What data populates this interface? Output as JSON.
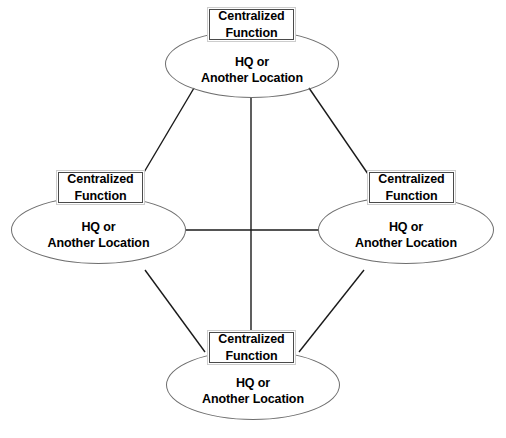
{
  "diagram": {
    "type": "network-hub-diagram",
    "background_color": "#ffffff",
    "edge_color": "#1a1a1a",
    "ellipse_stroke_color": "#6e6e6e",
    "box_border_color": "#4a4a4a",
    "nodes": [
      {
        "id": "top",
        "box_title_line1": "Centralized",
        "box_title_line2": "Function",
        "location_line1": "HQ or",
        "location_line2": "Another Location"
      },
      {
        "id": "left",
        "box_title_line1": "Centralized",
        "box_title_line2": "Function",
        "location_line1": "HQ or",
        "location_line2": "Another Location"
      },
      {
        "id": "right",
        "box_title_line1": "Centralized",
        "box_title_line2": "Function",
        "location_line1": "HQ or",
        "location_line2": "Another Location"
      },
      {
        "id": "bottom",
        "box_title_line1": "Centralized",
        "box_title_line2": "Function",
        "location_line1": "HQ or",
        "location_line2": "Another Location"
      }
    ]
  }
}
